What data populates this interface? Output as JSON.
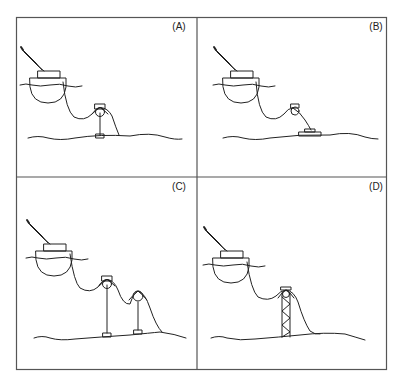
{
  "figure": {
    "panels": [
      {
        "id": "A",
        "label": "(A)",
        "support": "single mid-water arch on vertical column with base"
      },
      {
        "id": "B",
        "label": "(B)",
        "support": "buoy tethered to seabed clump weight"
      },
      {
        "id": "C",
        "label": "(C)",
        "support": "two mid-water arches on vertical columns with bases"
      },
      {
        "id": "D",
        "label": "(D)",
        "support": "lattice tower with arch on top"
      }
    ],
    "colors": {
      "line": "#222222",
      "frame": "#555555",
      "background": "#ffffff"
    }
  }
}
